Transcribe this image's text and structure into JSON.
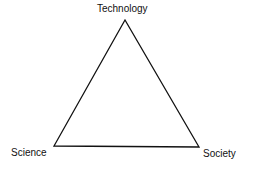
{
  "diagram": {
    "type": "triangle",
    "vertices": [
      {
        "id": "top",
        "label": "Technology",
        "x": 125,
        "y": 20
      },
      {
        "id": "left",
        "label": "Science",
        "x": 54,
        "y": 146
      },
      {
        "id": "right",
        "label": "Society",
        "x": 199,
        "y": 147
      }
    ],
    "stroke_color": "#111111",
    "background": "#ffffff"
  }
}
